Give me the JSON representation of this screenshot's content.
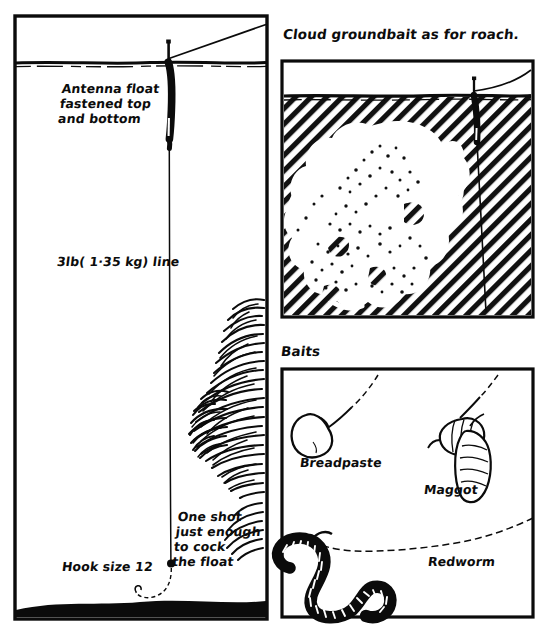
{
  "figure": {
    "type": "hand-drawn-angling-diagram",
    "title_text_visible": false,
    "background_color": "#ffffff",
    "ink_color": "#000000"
  },
  "panels": {
    "swim": {
      "name": "swim-cross-section-panel",
      "bounds": {
        "x": 14,
        "y": 15,
        "w": 254,
        "h": 605
      },
      "waterline_y": 63,
      "riverbed_top_y": 600,
      "labels": {
        "antenna_float": "Antenna float\nfastened top\nand bottom",
        "line_strength": "3lb( 1·35 kg) line",
        "hook_size": "Hook size 12",
        "one_shot": "One shot\njust enough\nto cock\nthe float"
      },
      "features": [
        "antenna-float",
        "fishing-line-to-rod",
        "split-shot",
        "hook",
        "weed-bed",
        "riverbed"
      ]
    },
    "groundbait": {
      "name": "cloud-groundbait-panel",
      "heading": "Cloud groundbait as for roach.",
      "bounds": {
        "x": 281,
        "y": 60,
        "w": 253,
        "h": 258
      },
      "waterline_y": 97,
      "features": [
        "hatched-water",
        "cloud-of-groundbait",
        "suspended-particles",
        "antenna-float",
        "fishing-line-to-rod"
      ]
    },
    "baits": {
      "name": "baits-panel",
      "heading": "Baits",
      "bounds": {
        "x": 281,
        "y": 368,
        "w": 253,
        "h": 250
      },
      "items": [
        {
          "label": "Breadpaste",
          "name": "breadpaste-bait"
        },
        {
          "label": "Maggot",
          "name": "maggot-bait"
        },
        {
          "label": "Redworm",
          "name": "redworm-bait"
        }
      ]
    }
  },
  "label_lines": {
    "antenna_float_l1": "Antenna float",
    "antenna_float_l2": "fastened top",
    "antenna_float_l3": "and bottom",
    "line_strength": "3lb( 1·35 kg) line",
    "hook_size": "Hook size 12",
    "one_shot_l1": "One shot",
    "one_shot_l2": "just enough",
    "one_shot_l3": "to cock",
    "one_shot_l4": "the float",
    "cloud_heading": "Cloud groundbait as for roach.",
    "baits_heading": "Baits",
    "breadpaste": "Breadpaste",
    "maggot": "Maggot",
    "redworm": "Redworm"
  }
}
